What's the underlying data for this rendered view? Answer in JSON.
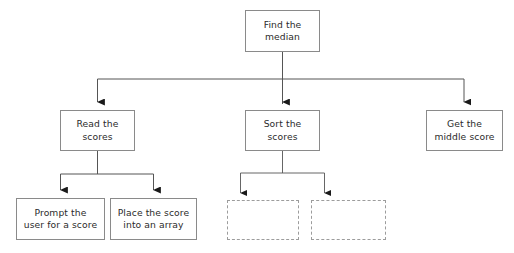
{
  "diagram": {
    "type": "hierarchy-flowchart",
    "canvas": {
      "width": 514,
      "height": 253,
      "background": "#ffffff"
    },
    "style": {
      "box_border_color": "#8a8a8a",
      "placeholder_border_color": "#9c9c9c",
      "connector_color": "#555555",
      "arrow_color": "#1a1a1a",
      "text_color": "#2b2b2b"
    },
    "levels": [
      {
        "name": "root",
        "count": 1
      },
      {
        "name": "second",
        "count": 3
      },
      {
        "name": "third",
        "count": 4
      }
    ],
    "nodes": [
      {
        "id": "find-the-median",
        "label": "Find the\nmedian",
        "level": 0,
        "kind": "box",
        "x": 245,
        "y": 10,
        "w": 75,
        "h": 42
      },
      {
        "id": "read-the-scores",
        "label": "Read the\nscores",
        "level": 1,
        "kind": "box",
        "x": 60,
        "y": 110,
        "w": 75,
        "h": 41
      },
      {
        "id": "sort-the-scores",
        "label": "Sort the\nscores",
        "level": 1,
        "kind": "box",
        "x": 245,
        "y": 110,
        "w": 75,
        "h": 41
      },
      {
        "id": "get-the-middle-score",
        "label": "Get the\nmiddle score",
        "level": 1,
        "kind": "box",
        "x": 426,
        "y": 110,
        "w": 77,
        "h": 41
      },
      {
        "id": "prompt-the-user-for-a-score",
        "label": "Prompt the\nuser for a score",
        "level": 2,
        "kind": "box",
        "x": 16,
        "y": 198,
        "w": 89,
        "h": 42
      },
      {
        "id": "place-the-score-into-an-array",
        "label": "Place the score\ninto an array",
        "level": 2,
        "kind": "box",
        "x": 110,
        "y": 198,
        "w": 87,
        "h": 42
      },
      {
        "id": "sort-child-placeholder-1",
        "label": "",
        "level": 2,
        "kind": "placeholder",
        "x": 227,
        "y": 200,
        "w": 72,
        "h": 40
      },
      {
        "id": "sort-child-placeholder-2",
        "label": "",
        "level": 2,
        "kind": "placeholder",
        "x": 311,
        "y": 200,
        "w": 75,
        "h": 40
      }
    ],
    "edges": [
      {
        "from": "find-the-median",
        "to": "read-the-scores",
        "arrow": true
      },
      {
        "from": "find-the-median",
        "to": "sort-the-scores",
        "arrow": true
      },
      {
        "from": "find-the-median",
        "to": "get-the-middle-score",
        "arrow": true
      },
      {
        "from": "read-the-scores",
        "to": "prompt-the-user-for-a-score",
        "arrow": true
      },
      {
        "from": "read-the-scores",
        "to": "place-the-score-into-an-array",
        "arrow": true
      },
      {
        "from": "sort-the-scores",
        "to": "sort-child-placeholder-1",
        "arrow": true
      },
      {
        "from": "sort-the-scores",
        "to": "sort-child-placeholder-2",
        "arrow": true
      }
    ]
  }
}
